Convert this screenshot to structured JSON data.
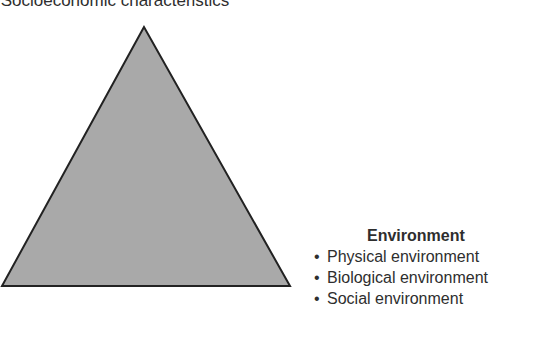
{
  "top_item": {
    "bullet": "•",
    "text": "Socioeconomic characteristics"
  },
  "triangle": {
    "fill": "#a9a9a9",
    "stroke": "#222222"
  },
  "environment": {
    "title": "Environment",
    "items": [
      {
        "bullet": "•",
        "text": "Physical environment"
      },
      {
        "bullet": "•",
        "text": "Biological environment"
      },
      {
        "bullet": "•",
        "text": "Social environment"
      }
    ]
  }
}
